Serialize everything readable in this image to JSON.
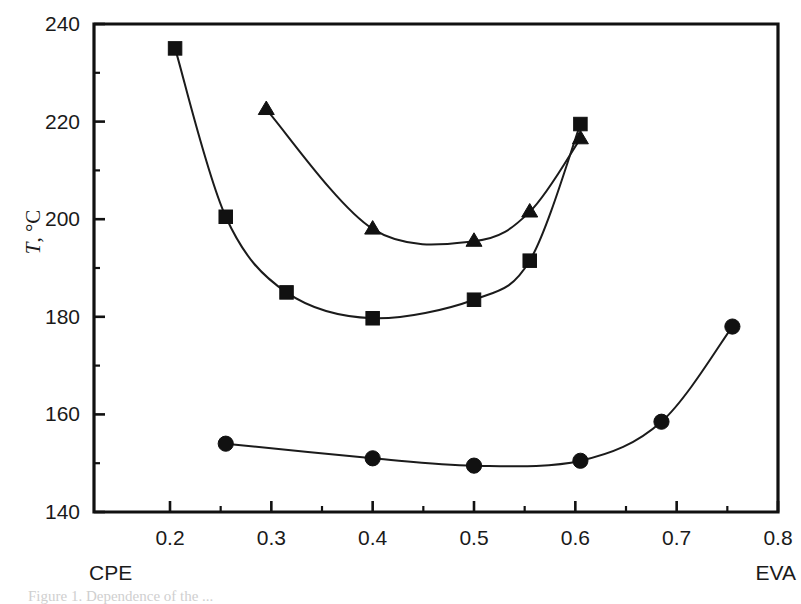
{
  "figure": {
    "background_color": "#ffffff",
    "ink_color": "#111111",
    "caption_partial": "Figure 1. Dependence of the ..."
  },
  "chart_data": {
    "type": "line",
    "title": "",
    "subtitle": "",
    "xlabel": "",
    "ylabel": "T, °C",
    "ylabel_symbol": "T",
    "ylabel_unit": ", °C",
    "xlim": [
      0.125,
      0.8
    ],
    "ylim": [
      140,
      240
    ],
    "grid": false,
    "legend": "none",
    "x_axis_left_label": "CPE",
    "x_axis_right_label": "EVA",
    "x_ticks": [
      0.2,
      0.3,
      0.4,
      0.5,
      0.6,
      0.7,
      0.8
    ],
    "x_tick_labels": [
      "0.2",
      "0.3",
      "0.4",
      "0.5",
      "0.6",
      "0.7",
      "0.8"
    ],
    "x_minor_ticks": [
      0.25,
      0.35,
      0.45,
      0.55,
      0.65,
      0.75
    ],
    "y_ticks": [
      140,
      160,
      180,
      200,
      220,
      240
    ],
    "y_tick_labels": [
      "140",
      "160",
      "180",
      "200",
      "220",
      "240"
    ],
    "y_minor_ticks": [
      150,
      170,
      190,
      210,
      230
    ],
    "series": [
      {
        "name": "square-series",
        "marker": "square",
        "points": [
          {
            "x": 0.205,
            "y": 235.0
          },
          {
            "x": 0.255,
            "y": 200.5
          },
          {
            "x": 0.315,
            "y": 185.0
          },
          {
            "x": 0.4,
            "y": 179.7
          },
          {
            "x": 0.5,
            "y": 183.5
          },
          {
            "x": 0.555,
            "y": 191.5
          },
          {
            "x": 0.605,
            "y": 219.5
          }
        ]
      },
      {
        "name": "triangle-series",
        "marker": "triangle",
        "points": [
          {
            "x": 0.295,
            "y": 222.5
          },
          {
            "x": 0.4,
            "y": 198.0
          },
          {
            "x": 0.5,
            "y": 195.5
          },
          {
            "x": 0.555,
            "y": 201.5
          },
          {
            "x": 0.605,
            "y": 216.5
          }
        ]
      },
      {
        "name": "circle-series",
        "marker": "circle",
        "points": [
          {
            "x": 0.255,
            "y": 154.0
          },
          {
            "x": 0.4,
            "y": 151.0
          },
          {
            "x": 0.5,
            "y": 149.5
          },
          {
            "x": 0.605,
            "y": 150.5
          },
          {
            "x": 0.685,
            "y": 158.5
          },
          {
            "x": 0.755,
            "y": 178.0
          }
        ]
      }
    ]
  }
}
